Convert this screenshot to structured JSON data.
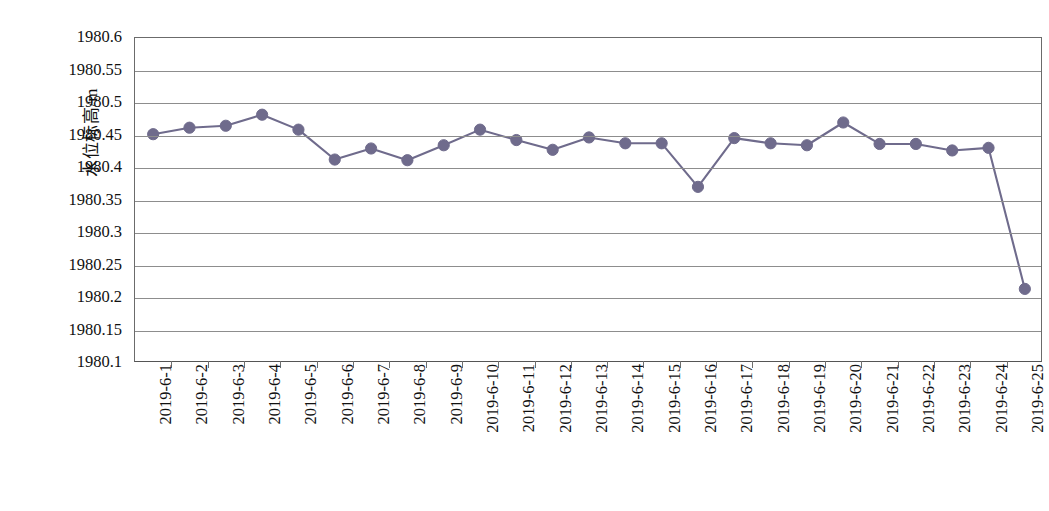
{
  "chart_data": {
    "type": "line",
    "title": "",
    "xlabel": "",
    "ylabel": "水位标高/m",
    "ylim": [
      1980.1,
      1980.6
    ],
    "ytick_step": 0.05,
    "grid": true,
    "legend": "none",
    "marker": "circle",
    "series_color": "#6f6b8c",
    "line_color": "#6f6b8c",
    "gridline_color": "#8d8d8d",
    "axis_color": "#6b6b6b",
    "ytick_labels": [
      "1980.6",
      "1980.55",
      "1980.5",
      "1980.45",
      "1980.4",
      "1980.35",
      "1980.3",
      "1980.25",
      "1980.2",
      "1980.15",
      "1980.1"
    ],
    "ytick_values": [
      1980.6,
      1980.55,
      1980.5,
      1980.45,
      1980.4,
      1980.35,
      1980.3,
      1980.25,
      1980.2,
      1980.15,
      1980.1
    ],
    "categories": [
      "2019-6-1",
      "2019-6-2",
      "2019-6-3",
      "2019-6-4",
      "2019-6-5",
      "2019-6-6",
      "2019-6-7",
      "2019-6-8",
      "2019-6-9",
      "2019-6-10",
      "2019-6-11",
      "2019-6-12",
      "2019-6-13",
      "2019-6-14",
      "2019-6-15",
      "2019-6-16",
      "2019-6-17",
      "2019-6-18",
      "2019-6-19",
      "2019-6-20",
      "2019-6-21",
      "2019-6-22",
      "2019-6-23",
      "2019-6-24",
      "2019-6-25"
    ],
    "series": [
      {
        "name": "水位标高",
        "values": [
          1980.452,
          1980.462,
          1980.465,
          1980.482,
          1980.459,
          1980.413,
          1980.43,
          1980.412,
          1980.435,
          1980.459,
          1980.443,
          1980.428,
          1980.447,
          1980.438,
          1980.438,
          1980.371,
          1980.446,
          1980.438,
          1980.435,
          1980.47,
          1980.437,
          1980.437,
          1980.427,
          1980.431,
          1980.214
        ]
      }
    ]
  },
  "caption": {
    "text": ""
  }
}
